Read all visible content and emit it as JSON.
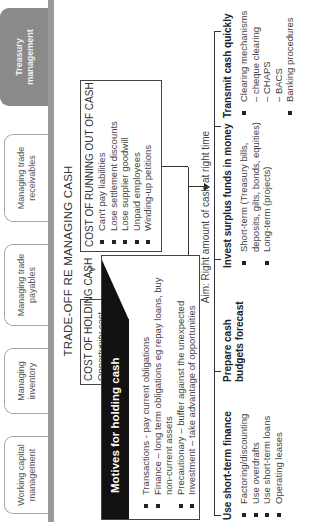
{
  "tabs": [
    {
      "label": "Working capital management",
      "active": false
    },
    {
      "label": "Managing inventory",
      "active": false
    },
    {
      "label": "Managing trade payables",
      "active": false
    },
    {
      "label": "Managing trade receivables",
      "active": false
    },
    {
      "label": "Treasury management",
      "active": true
    }
  ],
  "title": "TRADE-OFF RE MANAGING CASH",
  "cost_holding": {
    "title": "COST OF HOLDING CASH",
    "subtitle": "Opportunity cost"
  },
  "versus": "v",
  "cost_running_out": {
    "title": "COST OF RUNNING OUT OF CASH",
    "items": [
      "Can't pay liabilities",
      "Lose settlement discounts",
      "Lose supplier goodwill",
      "Unpaid employees",
      "Winding-up petitions"
    ]
  },
  "motives": {
    "title": "Motives for holding cash",
    "items": [
      {
        "text": "Transactions - pay current obligations",
        "bullet": true
      },
      {
        "text": "Finance – long term obligations eg repay loans, buy",
        "bullet": true
      },
      {
        "text": "non-current assets",
        "bullet": false
      },
      {
        "text": "Precautionary – buffer against the unexpected",
        "bullet": true
      },
      {
        "text": "Investment – take advantage of opportunities",
        "bullet": true
      }
    ]
  },
  "aim": "Aim: Right amount of cash at right time",
  "branches": [
    {
      "title": "Use short-term finance",
      "items": [
        {
          "text": "Factoring/discounting",
          "bullet": true
        },
        {
          "text": "Use overdrafts",
          "bullet": true
        },
        {
          "text": "Use short-term loans",
          "bullet": true
        },
        {
          "text": "Operating leases",
          "bullet": true
        }
      ]
    },
    {
      "title_lines": [
        "Prepare cash",
        "budgets forecast"
      ],
      "items": []
    },
    {
      "title": "Invest surplus funds in money",
      "items": [
        {
          "text": "Short-term (Treasury bills,",
          "bullet": true
        },
        {
          "text": "deposits, gilts, bonds, equities)",
          "bullet": false
        },
        {
          "text": "Long-term (projects)",
          "bullet": true
        }
      ]
    },
    {
      "title": "Transmit cash quickly",
      "items": [
        {
          "text": "Clearing mechanisms",
          "bullet": true
        },
        {
          "text": "– cheque clearing",
          "bullet": false
        },
        {
          "text": "– CHAPS",
          "bullet": false
        },
        {
          "text": "– BACS",
          "bullet": false
        },
        {
          "text": "Banking procedures",
          "bullet": true
        }
      ]
    }
  ],
  "colors": {
    "tab_active_bg": "#8a8a8a",
    "tab_bar": "#9a9a9a",
    "motives_header_bg": "#111111",
    "text": "#333333"
  }
}
